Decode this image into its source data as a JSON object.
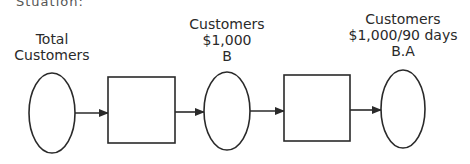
{
  "diagram": {
    "truncated_header": "Stuation:",
    "nodes": [
      {
        "id": "n1",
        "shape": "ellipse",
        "label_lines": [
          "Total",
          "Customers"
        ]
      },
      {
        "id": "p1",
        "shape": "rect",
        "label_lines": []
      },
      {
        "id": "n2",
        "shape": "ellipse",
        "label_lines": [
          "Customers",
          "$1,000",
          "B"
        ]
      },
      {
        "id": "p2",
        "shape": "rect",
        "label_lines": []
      },
      {
        "id": "n3",
        "shape": "ellipse",
        "label_lines": [
          "Customers",
          "$1,000/90 days",
          "B.A"
        ]
      }
    ],
    "edges": [
      {
        "from": "n1",
        "to": "p1"
      },
      {
        "from": "p1",
        "to": "n2"
      },
      {
        "from": "n2",
        "to": "p2"
      },
      {
        "from": "p2",
        "to": "n3"
      }
    ],
    "stroke_color": "#2a2a2a"
  }
}
